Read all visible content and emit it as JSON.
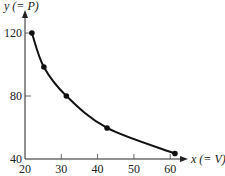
{
  "chart_data": {
    "type": "line",
    "title": "",
    "xlabel": "x (= V)",
    "ylabel": "y (= P)",
    "xlim": [
      20,
      65
    ],
    "ylim": [
      40,
      130
    ],
    "x_ticks": [
      20,
      30,
      40,
      50,
      60
    ],
    "y_ticks": [
      40,
      80,
      120
    ],
    "grid": false,
    "legend": null,
    "series": [
      {
        "name": "P vs V",
        "x": [
          21.9,
          25.2,
          31.4,
          42.6,
          61.3
        ],
        "y": [
          120,
          98.4,
          80,
          59.7,
          43.5
        ],
        "markers": true,
        "smooth": true
      }
    ]
  },
  "labels": {
    "x_axis": "x (= V)",
    "y_axis": "y (= P)",
    "x_ticks": [
      "20",
      "30",
      "40",
      "50",
      "60"
    ],
    "y_ticks": [
      "40",
      "80",
      "120"
    ]
  }
}
